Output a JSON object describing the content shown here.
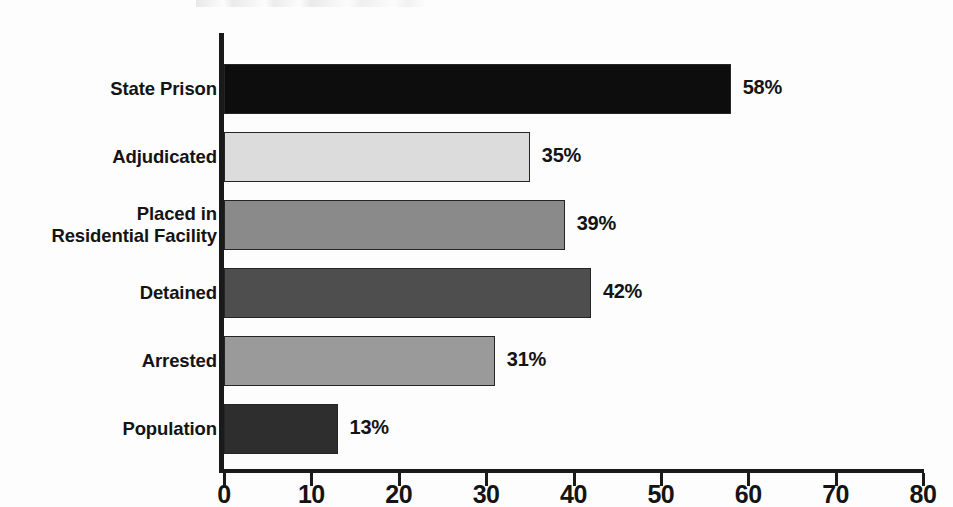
{
  "chart_data": {
    "type": "bar",
    "orientation": "horizontal",
    "title": "",
    "subtitle": "",
    "xlabel": "",
    "ylabel": "",
    "xlim": [
      0,
      80
    ],
    "grid": false,
    "legend": null,
    "value_suffix": "%",
    "axis_ticks": [
      0,
      10,
      20,
      30,
      40,
      50,
      60,
      70,
      80
    ],
    "categories": [
      "State Prison",
      "Adjudicated",
      "Placed in\nResidential Facility",
      "Detained",
      "Arrested",
      "Population"
    ],
    "values": [
      58,
      35,
      39,
      42,
      31,
      13
    ],
    "value_labels": [
      "58%",
      "35%",
      "39%",
      "42%",
      "31%",
      "13%"
    ],
    "bar_colors": [
      "#0d0d0d",
      "#dcdcdc",
      "#8a8a8a",
      "#4e4e4e",
      "#9a9a9a",
      "#2e2e2e"
    ],
    "bar_border_color": "#252525",
    "axis_color": "#1a1a1a",
    "text_color": "#141414",
    "background_color": "#fdfdfd"
  }
}
